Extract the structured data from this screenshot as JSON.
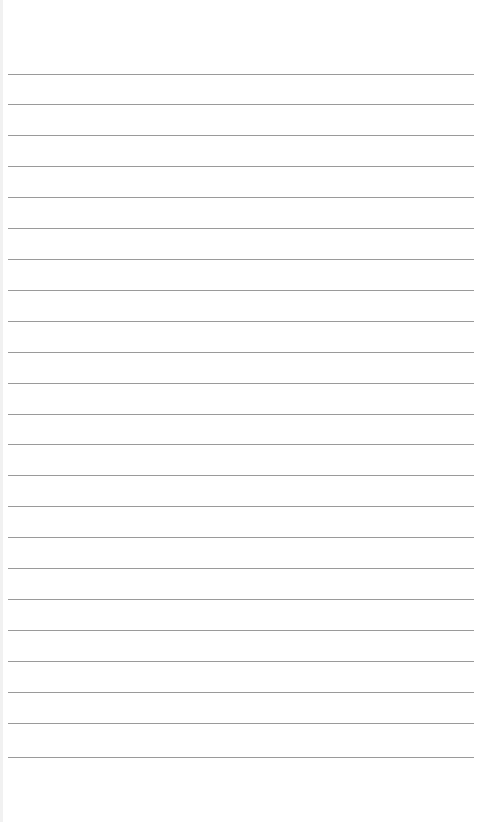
{
  "page": {
    "type": "blank-lined-paper",
    "line_count": 23,
    "line_color": "#9a9a9a",
    "background": "#ffffff",
    "lines_y": [
      74,
      104,
      135,
      166,
      197,
      228,
      259,
      290,
      321,
      352,
      383,
      414,
      444,
      475,
      506,
      537,
      568,
      599,
      630,
      661,
      692,
      723,
      757
    ]
  }
}
